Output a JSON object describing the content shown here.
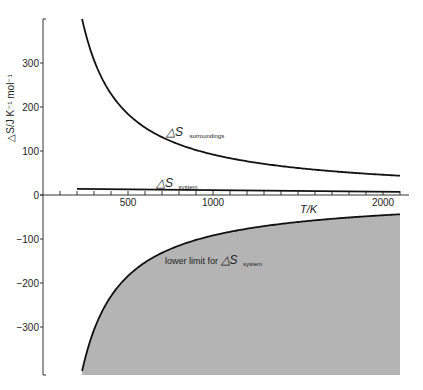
{
  "chart_data": {
    "type": "line",
    "title": "",
    "xlabel": "T/K",
    "ylabel": "△S/J K⁻¹ mol⁻¹",
    "xlim": [
      0,
      2150
    ],
    "ylim": [
      -400,
      400
    ],
    "x_ticks": [
      500,
      1000,
      2000
    ],
    "x_minor_tick_step": 100,
    "y_ticks": [
      300,
      200,
      100,
      0,
      -100,
      -200,
      -300
    ],
    "grid": false,
    "legend": "inline annotations",
    "series": [
      {
        "name": "△S surroundings",
        "x": [
          230,
          300,
          400,
          500,
          600,
          700,
          800,
          1000,
          1200,
          1400,
          1600,
          1800,
          2000,
          2100
        ],
        "values": [
          400,
          307,
          230,
          184,
          153,
          131,
          115,
          92,
          77,
          66,
          58,
          51,
          46,
          44
        ]
      },
      {
        "name": "△S system",
        "x": [
          200,
          2100
        ],
        "values": [
          14,
          7
        ]
      },
      {
        "name": "lower limit for △S system",
        "x": [
          230,
          300,
          400,
          500,
          600,
          700,
          800,
          1000,
          1200,
          1400,
          1600,
          1800,
          2000,
          2100
        ],
        "values": [
          -400,
          -307,
          -230,
          -184,
          -153,
          -131,
          -115,
          -92,
          -77,
          -66,
          -58,
          -51,
          -46,
          -44
        ],
        "fill": "below"
      }
    ],
    "annotations": {
      "surroundings": {
        "main": "△S",
        "sub": "surroundings"
      },
      "system": {
        "main": "△S",
        "sub": "system"
      },
      "lower_limit": {
        "prefix": "lower limit for ",
        "main": "△S",
        "sub": "system"
      }
    },
    "colors": {
      "line": "#111111",
      "fill": "#b4b4b4",
      "axis": "#333333"
    }
  }
}
